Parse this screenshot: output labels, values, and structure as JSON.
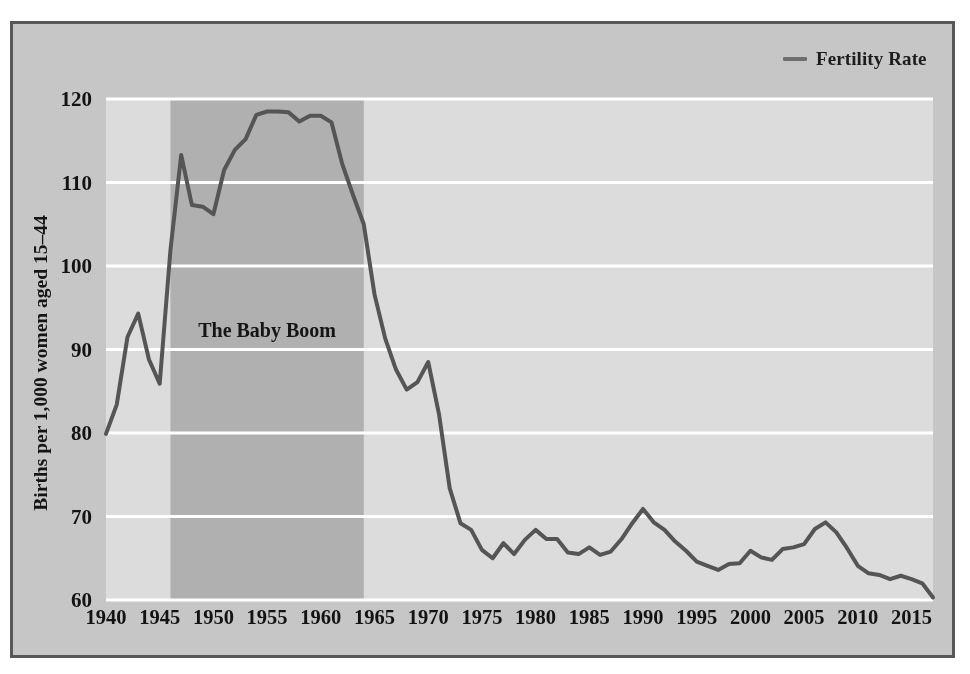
{
  "figure": {
    "background_color": "#c9c9c9",
    "frame_color": "#58585a",
    "plot_background_color": "#dcdcdc",
    "gridline_color": "#ffffff"
  },
  "legend": {
    "label": "Fertility Rate",
    "marker": "line-dash-marker",
    "color": "#6f6f6f",
    "position": "top-right"
  },
  "annotation": {
    "label": "The Baby Boom",
    "band_color": "#b0b0b0",
    "band_start_year": 1946,
    "band_end_year": 1964
  },
  "chart_data": {
    "type": "line",
    "title": "",
    "xlabel": "",
    "ylabel": "Births per 1,000 women aged 15–44",
    "xlim": [
      1940,
      2017
    ],
    "ylim": [
      60,
      120
    ],
    "grid": true,
    "grid_axis": "y",
    "legend_position": "top-right",
    "xticks": [
      1940,
      1945,
      1950,
      1955,
      1960,
      1965,
      1970,
      1975,
      1980,
      1985,
      1990,
      1995,
      2000,
      2005,
      2010,
      2015
    ],
    "xtick_labels": [
      "1940",
      "1945",
      "1950",
      "1955",
      "1960",
      "1965",
      "1970",
      "1975",
      "1980",
      "1985",
      "1990",
      "1995",
      "2000",
      "2005",
      "2010",
      "2015"
    ],
    "yticks": [
      60,
      70,
      80,
      90,
      100,
      110,
      120
    ],
    "ytick_labels": [
      "60",
      "70",
      "80",
      "90",
      "100",
      "110",
      "120"
    ],
    "series": [
      {
        "name": "Fertility Rate",
        "color": "#555555",
        "line_width": 4,
        "x": [
          1940,
          1941,
          1942,
          1943,
          1944,
          1945,
          1946,
          1947,
          1948,
          1949,
          1950,
          1951,
          1952,
          1953,
          1954,
          1955,
          1956,
          1957,
          1958,
          1959,
          1960,
          1961,
          1962,
          1963,
          1964,
          1965,
          1966,
          1967,
          1968,
          1969,
          1970,
          1971,
          1972,
          1973,
          1974,
          1975,
          1976,
          1977,
          1978,
          1979,
          1980,
          1981,
          1982,
          1983,
          1984,
          1985,
          1986,
          1987,
          1988,
          1989,
          1990,
          1991,
          1992,
          1993,
          1994,
          1995,
          1996,
          1997,
          1998,
          1999,
          2000,
          2001,
          2002,
          2003,
          2004,
          2005,
          2006,
          2007,
          2008,
          2009,
          2010,
          2011,
          2012,
          2013,
          2014,
          2015,
          2016,
          2017
        ],
        "y": [
          79.9,
          83.4,
          91.5,
          94.3,
          88.8,
          85.9,
          101.9,
          113.3,
          107.3,
          107.1,
          106.2,
          111.5,
          113.9,
          115.2,
          118.1,
          118.5,
          118.5,
          118.4,
          117.3,
          118.0,
          118.0,
          117.2,
          112.2,
          108.5,
          105.0,
          96.6,
          91.3,
          87.6,
          85.2,
          86.1,
          88.5,
          82.3,
          73.4,
          69.2,
          68.4,
          66.0,
          65.0,
          66.8,
          65.5,
          67.2,
          68.4,
          67.3,
          67.3,
          65.7,
          65.5,
          66.3,
          65.4,
          65.8,
          67.3,
          69.2,
          70.9,
          69.3,
          68.4,
          67.0,
          65.9,
          64.6,
          64.1,
          63.6,
          64.3,
          64.4,
          65.9,
          65.1,
          64.8,
          66.1,
          66.3,
          66.7,
          68.5,
          69.3,
          68.1,
          66.2,
          64.1,
          63.2,
          63.0,
          62.5,
          62.9,
          62.5,
          62.0,
          60.3
        ]
      }
    ]
  }
}
